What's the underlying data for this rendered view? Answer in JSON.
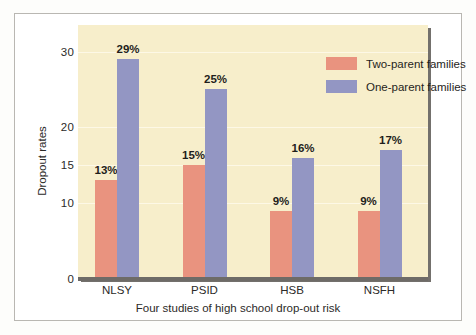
{
  "chart_data": {
    "type": "bar",
    "title": "",
    "xlabel": "Four studies of high school drop-out risk",
    "ylabel": "Dropout rates",
    "categories": [
      "NLSY",
      "PSID",
      "HSB",
      "NSFH"
    ],
    "series": [
      {
        "name": "Two-parent families",
        "color": "#e9937f",
        "values": [
          13,
          15,
          9,
          9
        ],
        "labels": [
          "13%",
          "15%",
          "9%",
          "9%"
        ]
      },
      {
        "name": "One-parent families",
        "color": "#9396c3",
        "values": [
          29,
          25,
          16,
          17
        ],
        "labels": [
          "29%",
          "25%",
          "16%",
          "17%"
        ]
      }
    ],
    "ylim": [
      0,
      33.5
    ],
    "yticks": [
      0,
      10,
      15,
      20,
      30
    ],
    "ytick_labels": [
      "0",
      "10",
      "15",
      "20",
      "30"
    ],
    "grid": true,
    "gridlines_at": [
      10,
      15,
      20,
      30
    ],
    "legend_position": "top-right",
    "plot_background": "#f7eecb",
    "figure_background": "#ffffff"
  },
  "legend": {
    "items": [
      {
        "label": "Two-parent families",
        "swatch": "#e9937f"
      },
      {
        "label": "One-parent families",
        "swatch": "#9396c3"
      }
    ]
  },
  "axes": {
    "y_title": "Dropout rates",
    "x_title": "Four studies of high school drop-out risk"
  }
}
